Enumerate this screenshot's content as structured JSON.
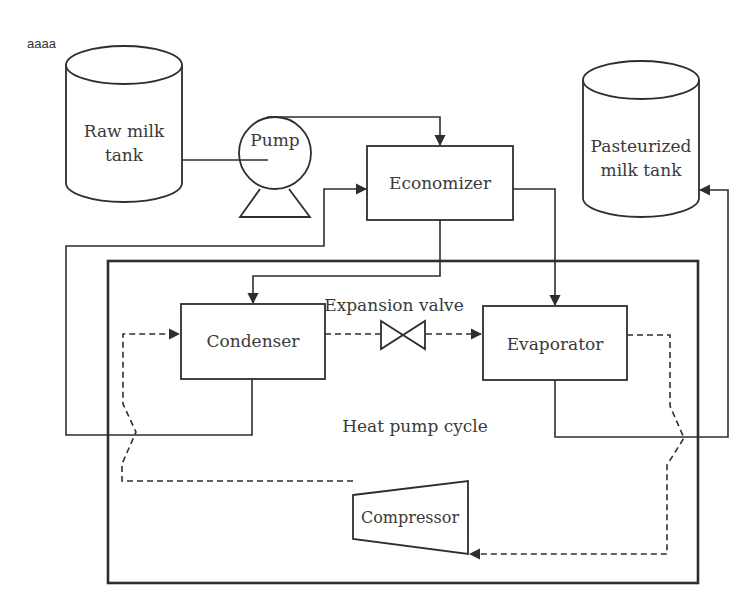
{
  "diagram": {
    "corner_note": "aaaa",
    "components": {
      "raw_milk_tank": {
        "line1": "Raw milk",
        "line2": "tank"
      },
      "pump": {
        "label": "Pump"
      },
      "economizer": {
        "label": "Economizer"
      },
      "pasteurized_milk_tank": {
        "line1": "Pasteurized",
        "line2": "milk tank"
      },
      "condenser": {
        "label": "Condenser"
      },
      "expansion_valve": {
        "label": "Expansion valve"
      },
      "evaporator": {
        "label": "Evaporator"
      },
      "compressor": {
        "label": "Compressor"
      },
      "heat_pump_cycle": {
        "label": "Heat pump cycle"
      }
    },
    "connections": [
      {
        "from": "raw_milk_tank",
        "to": "pump",
        "style": "solid"
      },
      {
        "from": "pump",
        "to": "economizer",
        "style": "solid",
        "arrow": true
      },
      {
        "from": "condenser",
        "to": "economizer",
        "style": "solid",
        "arrow": true
      },
      {
        "from": "economizer",
        "to": "condenser",
        "style": "solid",
        "arrow": true
      },
      {
        "from": "economizer",
        "to": "evaporator",
        "style": "solid",
        "arrow": true
      },
      {
        "from": "evaporator",
        "to": "pasteurized_milk_tank",
        "style": "solid",
        "arrow": true
      },
      {
        "from": "condenser",
        "to": "expansion_valve",
        "style": "dashed"
      },
      {
        "from": "expansion_valve",
        "to": "evaporator",
        "style": "dashed",
        "arrow": true
      },
      {
        "from": "evaporator",
        "to": "compressor",
        "style": "dashed",
        "arrow": true
      },
      {
        "from": "compressor",
        "to": "condenser",
        "style": "dashed",
        "arrow": true
      }
    ],
    "colors": {
      "line": "#2e2e2e",
      "text": "#3a3a3a",
      "background": "#ffffff"
    }
  }
}
